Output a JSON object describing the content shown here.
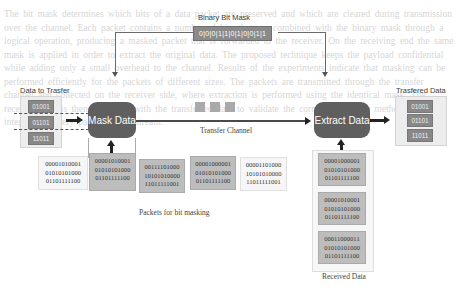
{
  "diagram": {
    "mask": {
      "label": "Binary Bit Mask",
      "bits": "0|0|0|1|1|0|1|0|0|1|1"
    },
    "input": {
      "label": "Data to Trasfer",
      "items": [
        "01001",
        "01101",
        "11011"
      ]
    },
    "processes": {
      "mask": "Mask Data",
      "extract": "Extract Data"
    },
    "channel": {
      "label": "Transfer Channel",
      "packet_count": 3
    },
    "packets": {
      "label": "Packets for bit masking",
      "items": [
        {
          "lines": [
            "00001010001",
            "01010101000",
            "01101111100"
          ],
          "shade": "light"
        },
        {
          "lines": [
            "00001010001",
            "01010101000",
            "01101111100"
          ],
          "shade": "dark"
        },
        {
          "lines": [
            "00111101000",
            "10101010000",
            "11011111001"
          ],
          "shade": "dark"
        },
        {
          "lines": [
            "00001000001",
            "01010101000",
            "01101111100"
          ],
          "shade": "dark"
        },
        {
          "lines": [
            "00001101000",
            "10101010000",
            "11011111001"
          ],
          "shade": "light"
        }
      ]
    },
    "received": {
      "label": "Received Data",
      "items": [
        {
          "lines": [
            "00001000001",
            "01010101000",
            "01101111100"
          ]
        },
        {
          "lines": [
            "00001010001",
            "01010101000",
            "01101111100"
          ]
        },
        {
          "lines": [
            "00011000011",
            "01010101000",
            "01101111100"
          ]
        }
      ]
    },
    "output": {
      "label": "Trasfered Data",
      "items": [
        "01001",
        "01101",
        "11011"
      ]
    },
    "colors": {
      "process_fill": "#5f5f5f",
      "chip_fill": "#888888",
      "panel_fill": "#ededed",
      "packet_dark": "#bdbdbd"
    }
  },
  "background_text": "The bit mask determines which bits of a data packet are preserved and which are cleared during transmission over the channel. Each packet contains a number of bits that are combined with the binary mask through a logical operation, producing a masked packet that is forwarded to the receiver. On the receiving end the same mask is applied in order to extract the original data. The proposed technique keeps the payload confidential while adding only a small overhead to the channel. Results of the experiments indicate that masking can be performed efficiently for the packets of different sizes. The packets are transmitted through the transfer channel and collected on the receiver side, where extraction is performed using the identical mask. The received data is then compared with the transferred data to validate the correctness of the method and the integrity of every packet in the stream."
}
